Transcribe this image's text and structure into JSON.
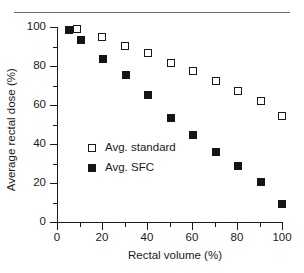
{
  "figure": {
    "has_top_rule": true,
    "background": "#ffffff",
    "ink_color": "#1a1a1a"
  },
  "chart_data": {
    "type": "scatter",
    "title": "",
    "xlabel": "Rectal volume (%)",
    "ylabel": "Average rectal dose (%)",
    "xlim": [
      0,
      100
    ],
    "ylim": [
      0,
      100
    ],
    "xticks": [
      0,
      20,
      40,
      60,
      80,
      100
    ],
    "yticks": [
      0,
      20,
      40,
      60,
      80,
      100
    ],
    "xtick_labels": [
      "0",
      "20",
      "40",
      "60",
      "80",
      "100"
    ],
    "ytick_labels": [
      "0",
      "20",
      "40",
      "60",
      "80",
      "100"
    ],
    "x_minor_tick_interval": 10,
    "y_minor_tick_interval": 10,
    "grid": false,
    "legend_position": "center-left",
    "series": [
      {
        "name": "Avg. standard",
        "marker": "open-square",
        "color": "#1a1a1a",
        "fill": "#ffffff",
        "points": [
          {
            "x": 9,
            "y": 99
          },
          {
            "x": 20,
            "y": 95
          },
          {
            "x": 30,
            "y": 90.5
          },
          {
            "x": 40.5,
            "y": 86.5
          },
          {
            "x": 50.5,
            "y": 81.5
          },
          {
            "x": 60.5,
            "y": 77.5
          },
          {
            "x": 70.5,
            "y": 72.5
          },
          {
            "x": 80.5,
            "y": 67
          },
          {
            "x": 90.5,
            "y": 62
          },
          {
            "x": 100,
            "y": 54.5
          }
        ]
      },
      {
        "name": "Avg. SFC",
        "marker": "filled-square",
        "color": "#151515",
        "fill": "#151515",
        "points": [
          {
            "x": 5.5,
            "y": 98.5
          },
          {
            "x": 10.5,
            "y": 93.5
          },
          {
            "x": 20.5,
            "y": 83.5
          },
          {
            "x": 30.5,
            "y": 75.5
          },
          {
            "x": 40.5,
            "y": 65
          },
          {
            "x": 50.5,
            "y": 53.5
          },
          {
            "x": 60.5,
            "y": 44.5
          },
          {
            "x": 70.5,
            "y": 36
          },
          {
            "x": 80.5,
            "y": 28.5
          },
          {
            "x": 90.5,
            "y": 20.5
          },
          {
            "x": 100,
            "y": 9
          }
        ]
      }
    ]
  },
  "legend": {
    "entries": [
      {
        "label": "Avg. standard",
        "marker": "open-square"
      },
      {
        "label": "Avg. SFC",
        "marker": "filled-square"
      }
    ]
  }
}
